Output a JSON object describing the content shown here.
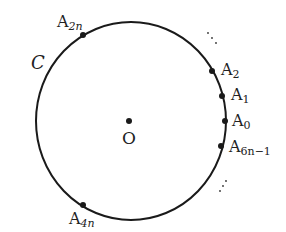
{
  "diagram": {
    "circle_label": "C",
    "center_label": "O",
    "points": [
      {
        "name": "A2n",
        "main": "A",
        "sub": "2n"
      },
      {
        "name": "A2",
        "main": "A",
        "sub": "2"
      },
      {
        "name": "A1",
        "main": "A",
        "sub": "1"
      },
      {
        "name": "A0",
        "main": "A",
        "sub": "0"
      },
      {
        "name": "A6n-1",
        "main": "A",
        "sub": "6n−1"
      },
      {
        "name": "A4n",
        "main": "A",
        "sub": "4n"
      }
    ],
    "ellipsis_top": "⋰",
    "ellipsis_bottom": "⋰",
    "stroke_color": "#1a1a1a"
  }
}
